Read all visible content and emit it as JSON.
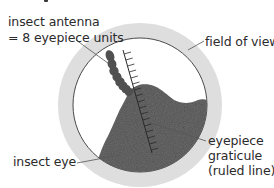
{
  "diagram": {
    "type": "labelled-microscope-field-of-view",
    "heading_fragment": "",
    "labels": {
      "antenna_line1": "insect antenna",
      "antenna_line2": "= 8 eyepiece units",
      "field_of_view": "field of view",
      "insect_eye": "insect eye",
      "graticule_line1": "eyepiece",
      "graticule_line2": "graticule",
      "graticule_line3": "(ruled line)"
    },
    "components": [
      {
        "name": "field-of-view",
        "shape": "circle",
        "description": "white circular view with light grey ring"
      },
      {
        "name": "insect-antenna",
        "shape": "segmented chain",
        "description": "beaded dark antenna, 8 eyepiece units long"
      },
      {
        "name": "insect-eye",
        "shape": "irregular blob",
        "description": "large dark grey textured mass"
      },
      {
        "name": "eyepiece-graticule",
        "shape": "ruled line",
        "description": "diagonal scale with tick marks"
      }
    ],
    "measurement": {
      "subject": "insect antenna",
      "value": 8,
      "unit": "eyepiece units"
    },
    "colors": {
      "ring": "#dcdcdc",
      "view": "#ffffff",
      "view_border": "#4a4a4a",
      "insect": "#4d4d4d",
      "leader_line": "#555555",
      "text": "#2b2b2b"
    }
  }
}
